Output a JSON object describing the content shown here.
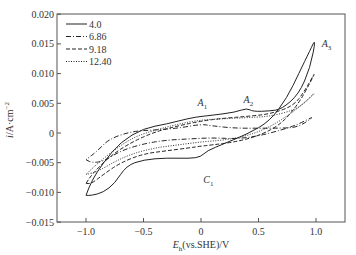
{
  "chart_data": {
    "type": "line",
    "title": "",
    "xlabel": "E_h(vs.SHE)/V",
    "ylabel": "i/A·cm^-2",
    "xlim": [
      -1.15,
      1.25
    ],
    "ylim": [
      -0.015,
      0.02
    ],
    "grid": false,
    "legend_position": "upper left",
    "x_ticks": [
      -1.0,
      -0.5,
      0,
      0.5,
      1.0
    ],
    "x_tick_labels": [
      "−1.0",
      "−0.5",
      "0",
      "0.5",
      "1.0"
    ],
    "y_ticks": [
      0.02,
      0.015,
      0.01,
      0.005,
      0,
      -0.005,
      -0.01,
      -0.015
    ],
    "y_tick_labels": [
      "0.020",
      "0.015",
      "0.010",
      "0.005",
      "0",
      "−0.005",
      "−0.010",
      "−0.015"
    ],
    "annotations": [
      {
        "text": "A",
        "sub": "1",
        "x": -0.03,
        "y": 0.0045
      },
      {
        "text": "A",
        "sub": "2",
        "x": 0.37,
        "y": 0.0051
      },
      {
        "text": "A",
        "sub": "3",
        "x": 1.05,
        "y": 0.0145
      },
      {
        "text": "C",
        "sub": "1",
        "x": 0.02,
        "y": -0.0085
      }
    ],
    "series": [
      {
        "name": "4.0",
        "style": "solid",
        "points": [
          [
            -1.0,
            -0.0105
          ],
          [
            -0.95,
            -0.0105
          ],
          [
            -0.85,
            -0.01
          ],
          [
            -0.75,
            -0.0085
          ],
          [
            -0.65,
            -0.0055
          ],
          [
            -0.5,
            -0.0045
          ],
          [
            -0.3,
            -0.0042
          ],
          [
            -0.1,
            -0.0043
          ],
          [
            0.0,
            -0.004
          ],
          [
            0.05,
            -0.003
          ],
          [
            0.2,
            -0.0018
          ],
          [
            0.4,
            -0.0002
          ],
          [
            0.6,
            0.002
          ],
          [
            0.75,
            0.006
          ],
          [
            0.85,
            0.01
          ],
          [
            0.95,
            0.014
          ],
          [
            1.0,
            0.016
          ],
          [
            0.95,
            0.011
          ],
          [
            0.85,
            0.0065
          ],
          [
            0.7,
            0.004
          ],
          [
            0.6,
            0.0037
          ],
          [
            0.45,
            0.0036
          ],
          [
            0.4,
            0.0042
          ],
          [
            0.3,
            0.0035
          ],
          [
            0.1,
            0.003
          ],
          [
            0.0,
            0.0028
          ],
          [
            -0.1,
            0.0025
          ],
          [
            -0.3,
            0.0015
          ],
          [
            -0.5,
            0.0008
          ],
          [
            -0.7,
            -0.0015
          ],
          [
            -0.85,
            -0.005
          ],
          [
            -0.95,
            -0.008
          ],
          [
            -1.0,
            -0.0105
          ]
        ]
      },
      {
        "name": "6.86",
        "style": "dashdot",
        "points": [
          [
            -1.0,
            -0.0045
          ],
          [
            -0.95,
            -0.005
          ],
          [
            -0.85,
            -0.0048
          ],
          [
            -0.7,
            -0.003
          ],
          [
            -0.5,
            -0.0018
          ],
          [
            -0.3,
            -0.0012
          ],
          [
            -0.1,
            -0.001
          ],
          [
            0.1,
            -0.0008
          ],
          [
            0.3,
            -0.001
          ],
          [
            0.5,
            -0.0005
          ],
          [
            0.7,
            0.0005
          ],
          [
            0.85,
            0.0015
          ],
          [
            1.0,
            0.003
          ],
          [
            0.85,
            0.001
          ],
          [
            0.7,
            0.0008
          ],
          [
            0.5,
            0.0008
          ],
          [
            0.3,
            0.0008
          ],
          [
            0.1,
            0.0012
          ],
          [
            0.0,
            0.0015
          ],
          [
            -0.2,
            0.0008
          ],
          [
            -0.4,
            0.0005
          ],
          [
            -0.6,
            0.0003
          ],
          [
            -0.8,
            -0.001
          ],
          [
            -0.9,
            -0.003
          ],
          [
            -1.0,
            -0.0045
          ]
        ]
      },
      {
        "name": "9.18",
        "style": "dashed",
        "points": [
          [
            -1.0,
            -0.0085
          ],
          [
            -0.95,
            -0.0085
          ],
          [
            -0.85,
            -0.007
          ],
          [
            -0.7,
            -0.005
          ],
          [
            -0.5,
            -0.0035
          ],
          [
            -0.3,
            -0.003
          ],
          [
            -0.1,
            -0.0025
          ],
          [
            0.0,
            -0.0022
          ],
          [
            0.1,
            -0.002
          ],
          [
            0.3,
            -0.0015
          ],
          [
            0.5,
            -0.0005
          ],
          [
            0.7,
            0.0015
          ],
          [
            0.85,
            0.005
          ],
          [
            0.95,
            0.0085
          ],
          [
            1.0,
            0.0105
          ],
          [
            0.9,
            0.007
          ],
          [
            0.8,
            0.0045
          ],
          [
            0.6,
            0.0032
          ],
          [
            0.4,
            0.0028
          ],
          [
            0.2,
            0.0025
          ],
          [
            0.0,
            0.002
          ],
          [
            -0.2,
            0.0012
          ],
          [
            -0.4,
            0.0002
          ],
          [
            -0.6,
            -0.0015
          ],
          [
            -0.8,
            -0.004
          ],
          [
            -0.95,
            -0.007
          ],
          [
            -1.0,
            -0.0085
          ]
        ]
      },
      {
        "name": "12.40",
        "style": "dotted",
        "points": [
          [
            -1.0,
            -0.007
          ],
          [
            -0.9,
            -0.0065
          ],
          [
            -0.75,
            -0.0048
          ],
          [
            -0.6,
            -0.0035
          ],
          [
            -0.4,
            -0.0025
          ],
          [
            -0.2,
            -0.002
          ],
          [
            0.0,
            -0.0015
          ],
          [
            0.2,
            -0.0012
          ],
          [
            0.4,
            -0.0005
          ],
          [
            0.6,
            0.001
          ],
          [
            0.8,
            0.0035
          ],
          [
            0.95,
            0.006
          ],
          [
            1.0,
            0.007
          ],
          [
            0.9,
            0.005
          ],
          [
            0.8,
            0.0038
          ],
          [
            0.6,
            0.0028
          ],
          [
            0.4,
            0.0026
          ],
          [
            0.2,
            0.0024
          ],
          [
            0.0,
            0.0022
          ],
          [
            -0.2,
            0.0015
          ],
          [
            -0.4,
            0.0005
          ],
          [
            -0.6,
            -0.0008
          ],
          [
            -0.8,
            -0.0035
          ],
          [
            -0.95,
            -0.006
          ],
          [
            -1.0,
            -0.007
          ]
        ]
      }
    ]
  },
  "colors": {
    "axis": "#555555",
    "line": "#222222",
    "text": "#333333"
  }
}
